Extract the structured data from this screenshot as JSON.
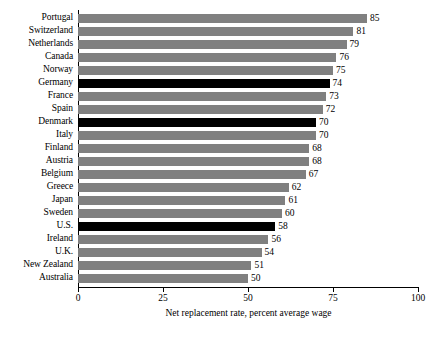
{
  "chart_data": {
    "type": "bar",
    "orientation": "horizontal",
    "title": "",
    "subtitle": "",
    "xlabel": "Net replacement rate, percent average wage",
    "ylabel": "",
    "xlim": [
      0,
      100
    ],
    "xticks": [
      0,
      25,
      50,
      75,
      100
    ],
    "xtick_labels": [
      "0",
      "25",
      "50",
      "75",
      "100"
    ],
    "grid": false,
    "legend": null,
    "categories": [
      "Portugal",
      "Switzerland",
      "Netherlands",
      "Canada",
      "Norway",
      "Germany",
      "France",
      "Spain",
      "Denmark",
      "Italy",
      "Finland",
      "Austria",
      "Belgium",
      "Greece",
      "Japan",
      "Sweden",
      "U.S.",
      "Ireland",
      "U.K.",
      "New Zealand",
      "Australia"
    ],
    "values": [
      85,
      81,
      79,
      76,
      75,
      74,
      73,
      72,
      70,
      70,
      68,
      68,
      67,
      62,
      61,
      60,
      58,
      56,
      54,
      51,
      50
    ],
    "value_labels": [
      "85",
      "81",
      "79",
      "76",
      "75",
      "74",
      "73",
      "72",
      "70",
      "70",
      "68",
      "68",
      "67",
      "62",
      "61",
      "60",
      "58",
      "56",
      "54",
      "51",
      "50"
    ],
    "highlighted": [
      "Germany",
      "Denmark",
      "U.S."
    ],
    "colors": {
      "bar": "#808080",
      "bar_highlight": "#000000",
      "axis": "#000000",
      "background": "#ffffff",
      "text": "#000000"
    }
  }
}
